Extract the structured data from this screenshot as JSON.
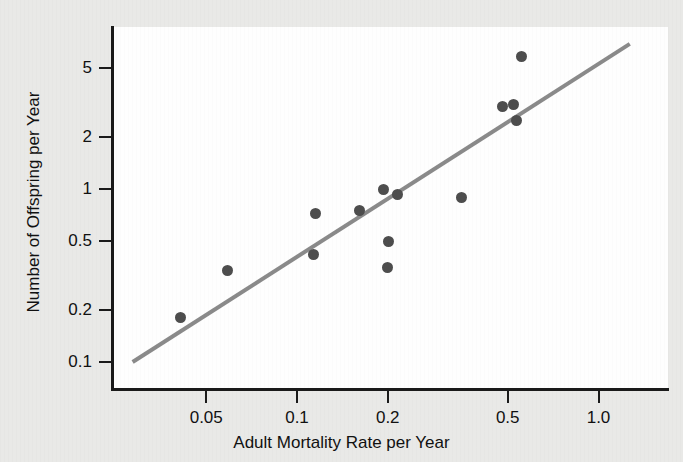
{
  "figure": {
    "background_color": "#e9e9e7",
    "plot_background_color": "#fefefe",
    "axis_color": "#1a1a1a",
    "point_color": "#4d4d4d",
    "trend_line_color": "#8a8a8a"
  },
  "chart_data": {
    "type": "scatter",
    "title": "",
    "subtitle": "",
    "xlabel": "Adult Mortality Rate per Year",
    "ylabel": "Number of Offspring per Year",
    "xscale": "log",
    "yscale": "log",
    "xlim": [
      0.027,
      1.27
    ],
    "ylim": [
      0.1,
      7.2
    ],
    "grid": false,
    "legend": null,
    "xticks": [
      0.05,
      0.1,
      0.2,
      0.5,
      1.0
    ],
    "xticklabels": [
      "0.05",
      "0.1",
      "0.2",
      "0.5",
      "1.0"
    ],
    "yticks": [
      0.1,
      0.2,
      0.5,
      1,
      2,
      5
    ],
    "yticklabels": [
      "0.1",
      "0.2",
      "0.5",
      "1",
      "2",
      "5"
    ],
    "x": [
      0.041,
      0.059,
      0.113,
      0.115,
      0.161,
      0.194,
      0.2,
      0.201,
      0.215,
      0.352,
      0.479,
      0.521,
      0.534,
      0.556
    ],
    "y": [
      0.18,
      0.34,
      0.42,
      0.72,
      0.75,
      0.99,
      0.35,
      0.5,
      0.93,
      0.89,
      3.0,
      3.09,
      2.49,
      5.84
    ],
    "points": [
      {
        "x": 0.041,
        "y": 0.18
      },
      {
        "x": 0.059,
        "y": 0.34
      },
      {
        "x": 0.113,
        "y": 0.42
      },
      {
        "x": 0.115,
        "y": 0.72
      },
      {
        "x": 0.161,
        "y": 0.75
      },
      {
        "x": 0.194,
        "y": 0.99
      },
      {
        "x": 0.2,
        "y": 0.35
      },
      {
        "x": 0.201,
        "y": 0.5
      },
      {
        "x": 0.215,
        "y": 0.93
      },
      {
        "x": 0.352,
        "y": 0.89
      },
      {
        "x": 0.479,
        "y": 3.0
      },
      {
        "x": 0.521,
        "y": 3.09
      },
      {
        "x": 0.534,
        "y": 2.49
      },
      {
        "x": 0.556,
        "y": 5.84
      }
    ],
    "trend_line": {
      "type": "linear-on-log-log",
      "x_start": 0.0285,
      "y_start": 0.1,
      "x_end": 1.27,
      "y_end": 6.9
    }
  }
}
